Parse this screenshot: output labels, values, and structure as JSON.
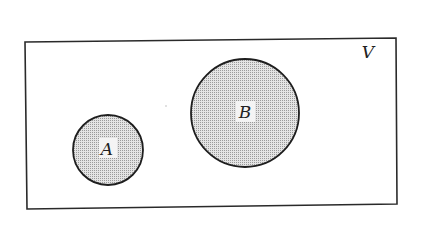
{
  "diagram": {
    "type": "venn",
    "universe": {
      "label": "V"
    },
    "sets": [
      {
        "label": "A",
        "shaded": true
      },
      {
        "label": "B",
        "shaded": true
      }
    ],
    "relationship": "disjoint"
  },
  "colors": {
    "stroke": "#1e1e1e",
    "fill": "#c8c8c8",
    "background": "#ffffff"
  }
}
